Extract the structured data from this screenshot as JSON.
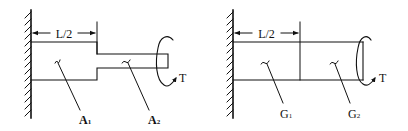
{
  "figures": [
    {
      "id": "left",
      "dimension_label": "L/2",
      "torque_label": "T",
      "section_labels": [
        {
          "main": "A",
          "sub": "1"
        },
        {
          "main": "A",
          "sub": "2"
        }
      ],
      "description": "Stepped shaft fixed at wall: thick segment of length L/2 (area A1) joined to thinner segment (area A2), torque T applied at free end"
    },
    {
      "id": "right",
      "dimension_label": "L/2",
      "torque_label": "T",
      "section_labels": [
        {
          "main": "G",
          "sub": "1"
        },
        {
          "main": "G",
          "sub": "2"
        }
      ],
      "description": "Uniform shaft fixed at wall made of two materials: first half length L/2 with shear modulus G1, second half with G2, torque T applied at free end"
    }
  ],
  "colors": {
    "stroke": "#111111",
    "background": "#ffffff"
  }
}
